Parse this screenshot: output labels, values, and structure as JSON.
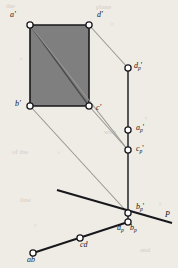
{
  "figure": {
    "background_color": "#efece6",
    "fill_color": "#7f7f7f",
    "stroke_dark": "#18171b",
    "stroke_light": "#9a9691",
    "marker_fill": "#ffffff",
    "marker_stroke": "#1a191d"
  },
  "labels": {
    "a_front": "a'",
    "d_front": "d'",
    "b_front": "b'",
    "c_front": "c'",
    "d_p_front": "d",
    "d_p_front_sub": "p",
    "d_p_front_prime": "'",
    "a_p_front": "a",
    "a_p_front_sub": "p",
    "a_p_front_prime": "'",
    "c_p_front": "c",
    "c_p_front_sub": "p",
    "c_p_front_prime": "'",
    "b_p_front": "b",
    "b_p_front_sub": "p",
    "b_p_front_prime": "'",
    "d_p_top": "d",
    "d_p_top_sub": "p",
    "b_p_top": "b",
    "b_p_top_sub": "p",
    "plane": "P",
    "ab_top": "ab",
    "cd_top": "cd"
  },
  "geometry": {
    "rect_front": {
      "a": [
        30,
        25
      ],
      "d": [
        89,
        25
      ],
      "c": [
        89,
        106
      ],
      "b": [
        30,
        106
      ],
      "diagonal": [
        [
          30,
          25
        ],
        [
          89,
          106
        ]
      ]
    },
    "vertical_projection_line": {
      "x": 128,
      "y_top": 68,
      "y_bottom": 222
    },
    "projected_points": {
      "d_p": [
        128,
        68
      ],
      "a_p": [
        128,
        130
      ],
      "c_p": [
        128,
        150
      ],
      "b_p": [
        128,
        213
      ],
      "dp_bp_top": [
        128,
        222
      ]
    },
    "ground_line_P": [
      [
        57,
        190
      ],
      [
        172,
        223
      ]
    ],
    "top_view_line": [
      [
        33,
        253
      ],
      [
        128,
        222
      ]
    ],
    "top_view_points": {
      "ab": [
        33,
        253
      ],
      "cd": [
        80,
        238
      ]
    },
    "projector_rays": [
      [
        [
          89,
          25
        ],
        [
          128,
          68
        ]
      ],
      [
        [
          30,
          25
        ],
        [
          128,
          150
        ]
      ],
      [
        [
          89,
          106
        ],
        [
          128,
          150
        ]
      ],
      [
        [
          30,
          106
        ],
        [
          128,
          213
        ]
      ]
    ]
  },
  "ghost_text": [
    "the",
    "for",
    "and",
    "with",
    "line",
    "plane",
    "view",
    "of the"
  ]
}
